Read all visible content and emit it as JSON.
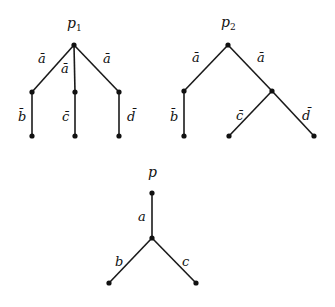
{
  "diagrams": [
    {
      "name": "p1",
      "title": "p",
      "subscript": "1",
      "edge_labels": [
        "ā",
        "ā",
        "ā",
        "b̄",
        "c̄",
        "d̄"
      ]
    },
    {
      "name": "p2",
      "title": "p",
      "subscript": "2",
      "edge_labels": [
        "ā",
        "ā",
        "b̄",
        "c̄",
        "d̄"
      ]
    },
    {
      "name": "p",
      "title": "p",
      "edge_labels": [
        "a",
        "b",
        "c"
      ]
    }
  ]
}
